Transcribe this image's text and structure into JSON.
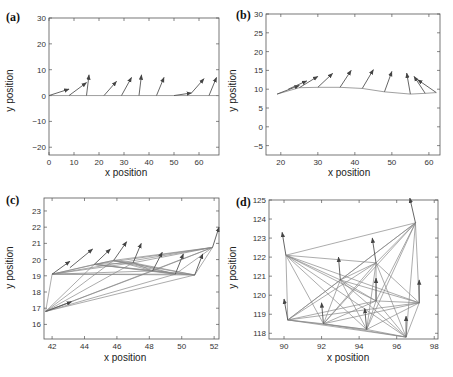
{
  "figure": {
    "panels": [
      {
        "id": "a",
        "label": "(a)",
        "xlabel": "x position",
        "ylabel": "y position",
        "xticks": [
          0,
          10,
          20,
          30,
          40,
          50,
          60
        ],
        "yticks": [
          -20,
          -10,
          0,
          10,
          20,
          30
        ]
      },
      {
        "id": "b",
        "label": "(b)",
        "xlabel": "x position",
        "ylabel": "y position",
        "xticks": [
          20,
          30,
          40,
          50,
          60
        ],
        "yticks": [
          -5,
          0,
          5,
          10,
          15,
          20,
          25,
          30
        ]
      },
      {
        "id": "c",
        "label": "(c)",
        "xlabel": "x position",
        "ylabel": "y position",
        "xticks": [
          42,
          44,
          46,
          48,
          50,
          52
        ],
        "yticks": [
          16,
          17,
          18,
          19,
          20,
          21,
          22,
          23
        ]
      },
      {
        "id": "d",
        "label": "(d)",
        "xlabel": "x position",
        "ylabel": "y position",
        "xticks": [
          90,
          92,
          94,
          96,
          98
        ],
        "yticks": [
          118,
          119,
          120,
          121,
          122,
          123,
          124,
          125
        ]
      }
    ]
  },
  "chart_data": [
    {
      "type": "scatter",
      "title": "(a)",
      "xlabel": "x position",
      "ylabel": "y position",
      "xlim": [
        0,
        68
      ],
      "ylim": [
        -23,
        30
      ],
      "grid": false,
      "description": "Agents on a horizontal line (y=0) with heading arrows",
      "trajectory": {
        "x": [
          0,
          68
        ],
        "y": [
          0,
          0
        ]
      },
      "arrows": [
        {
          "x0": 0,
          "y0": 0,
          "x1": 8,
          "y1": 2.5
        },
        {
          "x0": 8,
          "y0": 0,
          "x1": 15,
          "y1": 5
        },
        {
          "x0": 15,
          "y0": 0,
          "x1": 16,
          "y1": 8
        },
        {
          "x0": 22,
          "y0": 0,
          "x1": 27,
          "y1": 5.5
        },
        {
          "x0": 29,
          "y0": 0,
          "x1": 33,
          "y1": 7
        },
        {
          "x0": 36,
          "y0": 0,
          "x1": 37,
          "y1": 8
        },
        {
          "x0": 43,
          "y0": 0,
          "x1": 46,
          "y1": 7
        },
        {
          "x0": 50,
          "y0": 0,
          "x1": 57,
          "y1": 1
        },
        {
          "x0": 57,
          "y0": 1,
          "x1": 62,
          "y1": 6.5
        },
        {
          "x0": 64,
          "y0": 0,
          "x1": 67,
          "y1": 7
        }
      ]
    },
    {
      "type": "scatter",
      "title": "(b)",
      "xlabel": "x position",
      "ylabel": "y position",
      "xlim": [
        16,
        63
      ],
      "ylim": [
        -7.5,
        30
      ],
      "grid": false,
      "description": "Agents on a curved line with heading arrows",
      "trajectory": {
        "x": [
          19,
          25,
          30,
          36,
          42,
          48,
          55,
          59,
          62
        ],
        "y": [
          8.7,
          10.4,
          10.5,
          10.5,
          10.2,
          9.3,
          8.7,
          8.9,
          9.1
        ]
      },
      "arrows": [
        {
          "x0": 19,
          "y0": 8.7,
          "x1": 25,
          "y1": 11
        },
        {
          "x0": 22,
          "y0": 10,
          "x1": 27,
          "y1": 12.2
        },
        {
          "x0": 25,
          "y0": 10.4,
          "x1": 30,
          "y1": 13.4
        },
        {
          "x0": 30,
          "y0": 10.5,
          "x1": 34,
          "y1": 14.2
        },
        {
          "x0": 36,
          "y0": 10.5,
          "x1": 39,
          "y1": 15
        },
        {
          "x0": 42,
          "y0": 10.2,
          "x1": 45,
          "y1": 15.2
        },
        {
          "x0": 48,
          "y0": 9.3,
          "x1": 50,
          "y1": 14.7
        },
        {
          "x0": 55,
          "y0": 8.7,
          "x1": 54,
          "y1": 14.3
        },
        {
          "x0": 59,
          "y0": 8.9,
          "x1": 56,
          "y1": 13.4
        },
        {
          "x0": 62,
          "y0": 9.1,
          "x1": 57,
          "y1": 12.5
        }
      ]
    },
    {
      "type": "scatter",
      "title": "(c)",
      "xlabel": "x position",
      "ylabel": "y position",
      "xlim": [
        41.5,
        52.3
      ],
      "ylim": [
        15.1,
        23.8
      ],
      "grid": false,
      "description": "Agents connected by communication links with heading arrows",
      "nodes": [
        {
          "x": 41.6,
          "y": 16.8
        },
        {
          "x": 42.0,
          "y": 19.1
        },
        {
          "x": 44.6,
          "y": 19.7
        },
        {
          "x": 45.8,
          "y": 19.95
        },
        {
          "x": 47.0,
          "y": 19.8
        },
        {
          "x": 48.2,
          "y": 19.3
        },
        {
          "x": 49.6,
          "y": 19.1
        },
        {
          "x": 50.8,
          "y": 19.05
        },
        {
          "x": 51.9,
          "y": 20.75
        }
      ],
      "arrows": [
        {
          "x0": 41.6,
          "y0": 16.8,
          "x1": 43.2,
          "y1": 17.4
        },
        {
          "x0": 42.0,
          "y0": 19.1,
          "x1": 43.1,
          "y1": 19.9
        },
        {
          "x0": 43.1,
          "y0": 19.5,
          "x1": 44.5,
          "y1": 20.65
        },
        {
          "x0": 44.6,
          "y0": 19.7,
          "x1": 45.6,
          "y1": 20.65
        },
        {
          "x0": 45.8,
          "y0": 19.95,
          "x1": 46.6,
          "y1": 21.1
        },
        {
          "x0": 47.0,
          "y0": 19.8,
          "x1": 47.5,
          "y1": 21.0
        },
        {
          "x0": 48.2,
          "y0": 19.3,
          "x1": 48.8,
          "y1": 20.45
        },
        {
          "x0": 49.6,
          "y0": 19.1,
          "x1": 50.1,
          "y1": 20.35
        },
        {
          "x0": 50.8,
          "y0": 19.05,
          "x1": 51.3,
          "y1": 20.35
        },
        {
          "x0": 51.9,
          "y0": 20.75,
          "x1": 52.3,
          "y1": 22.0
        }
      ]
    },
    {
      "type": "scatter",
      "title": "(d)",
      "xlabel": "x position",
      "ylabel": "y position",
      "xlim": [
        89.2,
        98.2
      ],
      "ylim": [
        117.7,
        125
      ],
      "grid": false,
      "description": "Agents connected by dense communication graph with upward heading arrows",
      "nodes": [
        {
          "x": 90.1,
          "y": 122.1
        },
        {
          "x": 90.2,
          "y": 118.7
        },
        {
          "x": 92.1,
          "y": 118.5
        },
        {
          "x": 93.0,
          "y": 120.8
        },
        {
          "x": 94.4,
          "y": 118.2
        },
        {
          "x": 94.9,
          "y": 121.7
        },
        {
          "x": 94.9,
          "y": 119.7
        },
        {
          "x": 96.5,
          "y": 117.8
        },
        {
          "x": 97.2,
          "y": 119.6
        },
        {
          "x": 97.0,
          "y": 123.8
        }
      ],
      "arrows": [
        {
          "x0": 90.1,
          "y0": 122.1,
          "x1": 89.9,
          "y1": 123.3
        },
        {
          "x0": 90.2,
          "y0": 118.7,
          "x1": 90.0,
          "y1": 119.8
        },
        {
          "x0": 92.1,
          "y0": 118.5,
          "x1": 92.0,
          "y1": 119.6
        },
        {
          "x0": 93.0,
          "y0": 120.8,
          "x1": 92.9,
          "y1": 122.0
        },
        {
          "x0": 94.4,
          "y0": 118.2,
          "x1": 94.3,
          "y1": 119.3
        },
        {
          "x0": 94.9,
          "y0": 121.7,
          "x1": 94.7,
          "y1": 123.0
        },
        {
          "x0": 94.9,
          "y0": 119.7,
          "x1": 94.9,
          "y1": 120.9
        },
        {
          "x0": 96.5,
          "y0": 117.8,
          "x1": 96.5,
          "y1": 118.9
        },
        {
          "x0": 97.2,
          "y0": 119.6,
          "x1": 97.2,
          "y1": 120.8
        },
        {
          "x0": 97.0,
          "y0": 123.8,
          "x1": 96.7,
          "y1": 125.1
        }
      ]
    }
  ]
}
